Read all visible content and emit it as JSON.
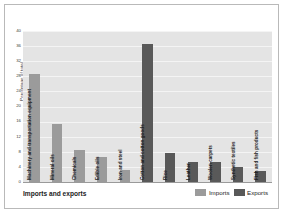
{
  "chart_data": {
    "type": "bar",
    "title": "Imports and exports",
    "xlabel": "",
    "ylabel": "Percentage of total",
    "ylim": [
      0,
      40
    ],
    "ytick_step": 4,
    "yticks": [
      40,
      36,
      32,
      28,
      24,
      20,
      16,
      12,
      8,
      4,
      0
    ],
    "grid": true,
    "legend_position": "bottom-right",
    "categories": [
      "Machinery and transportation equipment",
      "Mineral oils",
      "Chemicals",
      "Edible oils",
      "Iron and steel",
      "Cotton and cotton goods",
      "Rice",
      "Leather",
      "Woolen carpets",
      "Synthetic textiles",
      "Fish and fish products"
    ],
    "series": [
      {
        "name": "Imports",
        "color": "#9b9b9b",
        "values": [
          28.5,
          15.5,
          8.5,
          6.5,
          3.3,
          null,
          null,
          null,
          null,
          null,
          null
        ]
      },
      {
        "name": "Exports",
        "color": "#595959",
        "values": [
          null,
          null,
          null,
          null,
          null,
          36.5,
          7.8,
          5.3,
          5.3,
          4.0,
          2.8
        ]
      }
    ],
    "bars": [
      {
        "label": "Machinery and transportation equipment",
        "series": "Imports",
        "value": 28.5
      },
      {
        "label": "Mineral oils",
        "series": "Imports",
        "value": 15.5
      },
      {
        "label": "Chemicals",
        "series": "Imports",
        "value": 8.5
      },
      {
        "label": "Edible oils",
        "series": "Imports",
        "value": 6.5
      },
      {
        "label": "Iron and steel",
        "series": "Imports",
        "value": 3.3
      },
      {
        "label": "Cotton and cotton goods",
        "series": "Exports",
        "value": 36.5
      },
      {
        "label": "Rice",
        "series": "Exports",
        "value": 7.8
      },
      {
        "label": "Leather",
        "series": "Exports",
        "value": 5.3
      },
      {
        "label": "Woolen carpets",
        "series": "Exports",
        "value": 5.3
      },
      {
        "label": "Synthetic textiles",
        "series": "Exports",
        "value": 4.0
      },
      {
        "label": "Fish and fish products",
        "series": "Exports",
        "value": 2.8
      }
    ]
  },
  "legend": {
    "items": [
      {
        "label": "Imports",
        "color": "#9b9b9b"
      },
      {
        "label": "Exports",
        "color": "#595959"
      }
    ]
  }
}
